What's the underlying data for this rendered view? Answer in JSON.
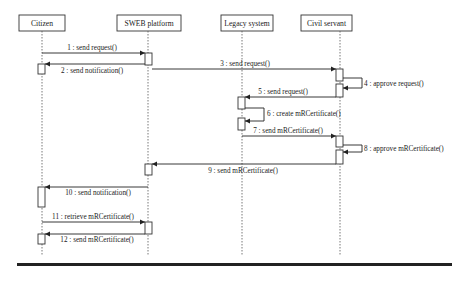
{
  "diagram": {
    "type": "sequence",
    "participants": [
      {
        "id": "citizen",
        "label": "Citizen",
        "box": [
          19,
          15,
          46,
          16
        ],
        "x": 42
      },
      {
        "id": "sweb",
        "label": "SWEB platform",
        "box": [
          117,
          15,
          64,
          16
        ],
        "x": 148
      },
      {
        "id": "legacy",
        "label": "Legacy system",
        "box": [
          221,
          15,
          52,
          16
        ],
        "x": 242
      },
      {
        "id": "civil",
        "label": "Civil servant",
        "box": [
          301,
          15,
          51,
          16
        ],
        "x": 340
      }
    ],
    "lifeline_end_y": 256,
    "messages": [
      {
        "n": 1,
        "label": "1 : send request()",
        "from": "citizen",
        "to": "sweb",
        "y": 53,
        "label_x": 92
      },
      {
        "n": 2,
        "label": "2 : send notification()",
        "from": "sweb",
        "to": "citizen",
        "y": 64,
        "label_x": 92
      },
      {
        "n": 3,
        "label": "3 : send request()",
        "from": "sweb",
        "to": "civil",
        "y": 69,
        "label_x": 245
      },
      {
        "n": 4,
        "label": "4 : approve request()",
        "from": "civil",
        "to": "civil",
        "y": 78,
        "label_x": 364,
        "self": true
      },
      {
        "n": 5,
        "label": "5 : send request()",
        "from": "civil",
        "to": "legacy",
        "y": 97,
        "label_x": 279
      },
      {
        "n": 6,
        "label": "6 : create mRCertificate()",
        "from": "legacy",
        "to": "legacy",
        "y": 108,
        "label_x": 268,
        "self": true
      },
      {
        "n": 7,
        "label": "7 : send mRCertificate()",
        "from": "legacy",
        "to": "civil",
        "y": 136,
        "label_x": 283
      },
      {
        "n": 8,
        "label": "8 : approve mRCertificate()",
        "from": "civil",
        "to": "civil",
        "y": 145,
        "label_x": 366,
        "self": true
      },
      {
        "n": 9,
        "label": "9 : send mRCertificate()",
        "from": "civil",
        "to": "sweb",
        "y": 164,
        "label_x": 243
      },
      {
        "n": 10,
        "label": "10 : send notification()",
        "from": "sweb",
        "to": "citizen",
        "y": 187,
        "label_x": 96
      },
      {
        "n": 11,
        "label": "11 : retrieve mRCertificate()",
        "from": "citizen",
        "to": "sweb",
        "y": 222,
        "label_x": 93
      },
      {
        "n": 12,
        "label": "12 : send mRCertificate()",
        "from": "sweb",
        "to": "citizen",
        "y": 234,
        "label_x": 96
      }
    ]
  }
}
